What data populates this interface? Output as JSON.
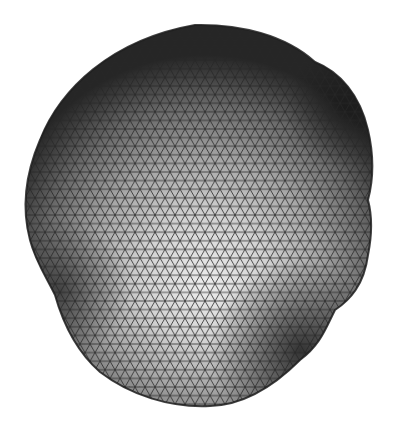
{
  "figure": {
    "subject": "triangulated mesh of a deformed sphere",
    "colors": {
      "background": "#ffffff",
      "highlight": "#e6e6e6",
      "midtone": "#a8a8a8",
      "shadow": "#3a3a3a",
      "edge": "#1e1e1e",
      "mesh_line": "#2a2a2a"
    },
    "mesh": {
      "cell_width": 10,
      "row_height": 8.6
    }
  }
}
